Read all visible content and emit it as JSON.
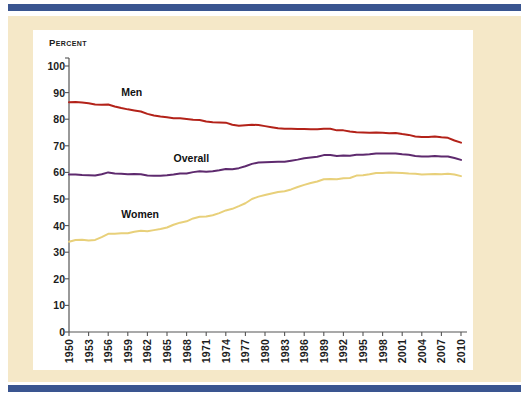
{
  "frame": {
    "rule_color": "#3a5590",
    "mat_color": "#f5e8c8",
    "card_color": "#ffffff"
  },
  "chart_data": {
    "type": "line",
    "title": "",
    "subtitle": "",
    "xlabel": "",
    "ylabel": "Percent",
    "ylim": [
      0,
      100
    ],
    "xlim": [
      1950,
      2010
    ],
    "grid": false,
    "legend": "inline-labels",
    "yticks": [
      0,
      10,
      20,
      30,
      40,
      50,
      60,
      70,
      80,
      90,
      100
    ],
    "xticks": [
      1950,
      1953,
      1956,
      1959,
      1962,
      1965,
      1968,
      1971,
      1974,
      1977,
      1980,
      1983,
      1986,
      1989,
      1992,
      1995,
      1998,
      2001,
      2004,
      2007,
      2010
    ],
    "x": [
      1950,
      1951,
      1952,
      1953,
      1954,
      1955,
      1956,
      1957,
      1958,
      1959,
      1960,
      1961,
      1962,
      1963,
      1964,
      1965,
      1966,
      1967,
      1968,
      1969,
      1970,
      1971,
      1972,
      1973,
      1974,
      1975,
      1976,
      1977,
      1978,
      1979,
      1980,
      1981,
      1982,
      1983,
      1984,
      1985,
      1986,
      1987,
      1988,
      1989,
      1990,
      1991,
      1992,
      1993,
      1994,
      1995,
      1996,
      1997,
      1998,
      1999,
      2000,
      2001,
      2002,
      2003,
      2004,
      2005,
      2006,
      2007,
      2008,
      2009,
      2010
    ],
    "series": [
      {
        "name": "Men",
        "color": "#b32219",
        "label_x": 1958,
        "label_y": 90,
        "values": [
          86.4,
          86.5,
          86.3,
          86.0,
          85.5,
          85.4,
          85.5,
          84.8,
          84.2,
          83.7,
          83.3,
          82.9,
          82.0,
          81.4,
          81.0,
          80.7,
          80.4,
          80.4,
          80.1,
          79.8,
          79.7,
          79.1,
          78.9,
          78.8,
          78.7,
          77.9,
          77.5,
          77.7,
          77.9,
          77.8,
          77.4,
          77.0,
          76.6,
          76.4,
          76.4,
          76.3,
          76.3,
          76.2,
          76.2,
          76.4,
          76.4,
          75.8,
          75.8,
          75.4,
          75.1,
          75.0,
          74.9,
          75.0,
          74.9,
          74.7,
          74.8,
          74.4,
          74.1,
          73.5,
          73.3,
          73.3,
          73.5,
          73.2,
          73.0,
          72.0,
          71.2
        ]
      },
      {
        "name": "Overall",
        "color": "#5e2a6e",
        "label_x": 1966,
        "label_y": 65,
        "values": [
          59.2,
          59.2,
          59.0,
          58.9,
          58.8,
          59.3,
          60.0,
          59.6,
          59.5,
          59.3,
          59.4,
          59.3,
          58.8,
          58.7,
          58.7,
          58.9,
          59.2,
          59.6,
          59.6,
          60.1,
          60.4,
          60.2,
          60.4,
          60.8,
          61.3,
          61.2,
          61.6,
          62.3,
          63.2,
          63.7,
          63.8,
          63.9,
          64.0,
          64.0,
          64.4,
          64.8,
          65.3,
          65.6,
          65.9,
          66.5,
          66.5,
          66.2,
          66.4,
          66.3,
          66.6,
          66.6,
          66.8,
          67.1,
          67.1,
          67.1,
          67.1,
          66.8,
          66.6,
          66.2,
          66.0,
          66.0,
          66.2,
          66.0,
          66.0,
          65.4,
          64.7
        ]
      },
      {
        "name": "Women",
        "color": "#e8d07a",
        "label_x": 1958,
        "label_y": 44,
        "values": [
          33.9,
          34.6,
          34.7,
          34.4,
          34.6,
          35.7,
          36.9,
          36.9,
          37.1,
          37.1,
          37.7,
          38.1,
          37.9,
          38.3,
          38.7,
          39.3,
          40.3,
          41.1,
          41.6,
          42.7,
          43.3,
          43.4,
          43.9,
          44.7,
          45.7,
          46.3,
          47.3,
          48.4,
          50.0,
          50.9,
          51.5,
          52.1,
          52.6,
          52.9,
          53.6,
          54.5,
          55.3,
          56.0,
          56.6,
          57.4,
          57.5,
          57.4,
          57.8,
          57.9,
          58.8,
          58.9,
          59.3,
          59.8,
          59.8,
          60.0,
          59.9,
          59.8,
          59.6,
          59.5,
          59.2,
          59.3,
          59.4,
          59.3,
          59.5,
          59.2,
          58.6
        ]
      }
    ]
  }
}
